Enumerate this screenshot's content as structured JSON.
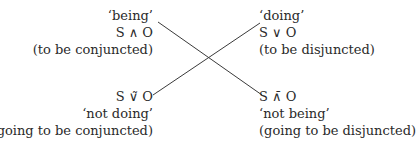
{
  "diagram": {
    "type": "square-of-opposition-cross",
    "line_color": "#3a3a3a",
    "nodes": {
      "top_left": {
        "gloss": "‘being’",
        "formula": "S ∧ O",
        "note": "(to be conjuncted)"
      },
      "top_right": {
        "gloss": "‘doing’",
        "formula": "S ∨ O",
        "note": "(to be disjuncted)"
      },
      "bottom_left": {
        "formula": "S ∨̃ O",
        "gloss": "‘not doing’",
        "note": "(going to be conjuncted)"
      },
      "bottom_right": {
        "formula": "S ∧̄ O",
        "gloss": "‘not being’",
        "note": "(going to be disjuncted)"
      }
    },
    "edges": [
      {
        "from": "top_left",
        "to": "bottom_right",
        "x1": 158,
        "y1": 22,
        "x2": 262,
        "y2": 95
      },
      {
        "from": "bottom_left",
        "to": "top_right",
        "x1": 153,
        "y1": 95,
        "x2": 260,
        "y2": 23
      }
    ]
  }
}
